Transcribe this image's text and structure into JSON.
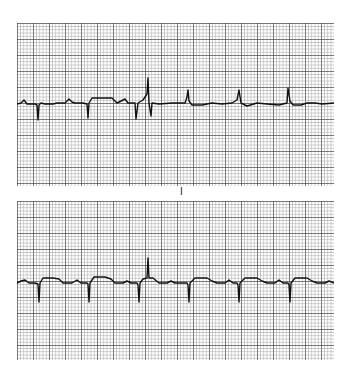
{
  "figure": {
    "lead_label": "I",
    "colors": {
      "paper": "#ffffff",
      "fine_grid": "#8a8a8a",
      "bold_grid": "#2a2a2a",
      "trace": "#111111"
    },
    "grid": {
      "fine_spacing_px": 3.2,
      "bold_every": 5
    },
    "strips": [
      {
        "id": "top",
        "x": 17,
        "y": 23,
        "width": 317,
        "height": 163,
        "baseline_y": 81,
        "trace_points": "0,81 4,80 7,77 10,81 18,81 20,82 21,97 22,82 24,80 28,81 32,81 36,81 40,80 48,80 52,76 55,79 58,80 66,80 70,81 71,95 72,80 75,75 84,75 95,75 100,80 108,76 111,80 118,80 119,96 121,80 126,77 130,71 131,55 132,80 134,93 135,80 142,81 155,80 168,80 170,74 171,67 172,78 175,82 185,82 195,80 205,81 215,80 220,77 222,67 224,80 230,83 240,80 250,81 262,82 270,80 271,65 273,78 276,82 284,82 290,80 298,80 305,81 317,80"
      },
      {
        "id": "bottom",
        "x": 17,
        "y": 201,
        "width": 317,
        "height": 159,
        "baseline_y": 82,
        "trace_points": "0,82 4,80 8,79 12,82 18,82 21,83 22,101 23,82 26,77 36,77 42,78 46,82 55,82 60,79 64,82 70,82 71,83 72,101 73,82 77,76 88,76 94,78 98,82 106,82 110,80 114,82 120,82 121,84 122,101 123,82 126,78 130,77 131,57 132,77 136,77 142,82 150,82 154,80 158,82 170,82 171,84 172,101 173,82 178,77 190,77 195,80 200,82 208,82 212,79 216,82 220,82 221,84 222,101 223,82 228,77 240,77 245,80 250,82 258,82 262,79 266,82 271,82 272,84 273,101 274,82 278,77 290,77 295,80 300,82 308,82 312,80 317,82"
      }
    ]
  }
}
